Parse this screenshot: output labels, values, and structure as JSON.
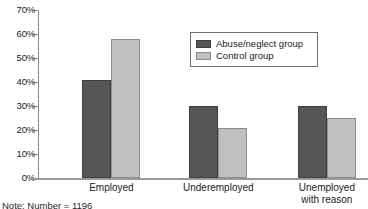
{
  "chart_data": {
    "type": "bar",
    "title": "",
    "subtitle": "",
    "xlabel": "",
    "ylabel": "",
    "ylim": [
      0,
      70
    ],
    "y_tick_values": [
      0,
      10,
      20,
      30,
      40,
      50,
      60,
      70
    ],
    "y_tick_labels": [
      "0%",
      "10%",
      "20%",
      "30%",
      "40%",
      "50%",
      "60%",
      "70%"
    ],
    "grid": false,
    "legend_position": "upper-right",
    "categories": [
      "Employed",
      "Underemployed",
      "Unemployed\nwith reason"
    ],
    "series": [
      {
        "name": "Abuse/neglect group",
        "color": "#565656",
        "values": [
          41,
          30,
          30
        ]
      },
      {
        "name": "Control group",
        "color": "#c0c0c0",
        "values": [
          58,
          21,
          25
        ]
      }
    ],
    "annotations": [
      "Note: Number = 1196"
    ]
  },
  "axis": {
    "ticks": [
      {
        "label": "70%",
        "value": 70
      },
      {
        "label": "60%",
        "value": 60
      },
      {
        "label": "50%",
        "value": 50
      },
      {
        "label": "40%",
        "value": 40
      },
      {
        "label": "30%",
        "value": 30
      },
      {
        "label": "20%",
        "value": 20
      },
      {
        "label": "10%",
        "value": 10
      },
      {
        "label": "0%",
        "value": 0
      }
    ]
  },
  "legend": {
    "entries": [
      {
        "label": "Abuse/neglect group",
        "swatch": "dark"
      },
      {
        "label": "Control group",
        "swatch": "light"
      }
    ]
  },
  "categories": [
    {
      "label": "Employed"
    },
    {
      "label": "Underemployed"
    },
    {
      "label": "Unemployed\nwith reason"
    }
  ],
  "footnote": {
    "text": "Note: Number = 1196"
  }
}
